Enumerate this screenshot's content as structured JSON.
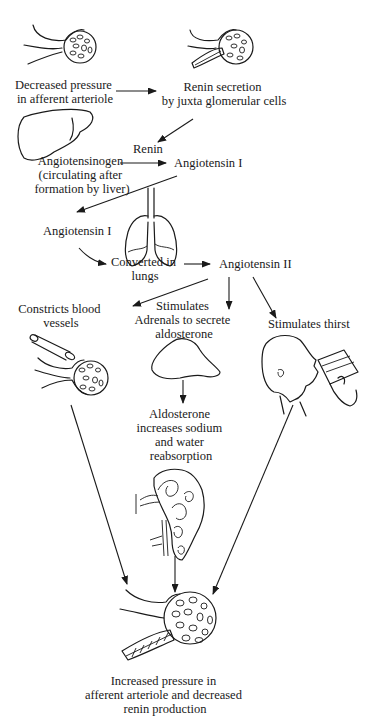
{
  "colors": {
    "ink": "#1a1a1a",
    "background": "#ffffff"
  },
  "nodes": {
    "decreased_pressure": [
      "Decreased pressure",
      "in afferent arteriole"
    ],
    "renin_secretion": [
      "Renin secretion",
      "by juxta glomerular cells"
    ],
    "renin": [
      "Renin"
    ],
    "angiotensinogen": [
      "Angiotensinogen",
      "(circulating after",
      "formation by liver)"
    ],
    "angiotensin_i_top": [
      "Angiotensin I"
    ],
    "angiotensin_i_left": [
      "Angiotensin I"
    ],
    "converted_in_lungs": [
      "Converted in",
      "lungs"
    ],
    "angiotensin_ii": [
      "Angiotensin II"
    ],
    "constricts": [
      "Constricts blood",
      "vessels"
    ],
    "stimulates_adrenals": [
      "Stimulates",
      "Adrenals to secrete",
      "aldosterone"
    ],
    "stimulates_thirst": [
      "Stimulates thirst"
    ],
    "aldosterone_effect": [
      "Aldosterone",
      "increases sodium",
      "and water",
      "reabsorption"
    ],
    "outcome": [
      "Increased pressure in",
      "afferent arteriole and decreased",
      "renin production"
    ]
  },
  "illustrations": [
    "glomerulus-icon",
    "glomerulus-juxtaglomerular-icon",
    "liver-icon",
    "lungs-icon",
    "blood-vessel-icon",
    "glomerulus-icon",
    "adrenal-gland-icon",
    "person-drinking-icon",
    "nephron-icon",
    "glomerulus-juxtaglomerular-icon"
  ]
}
